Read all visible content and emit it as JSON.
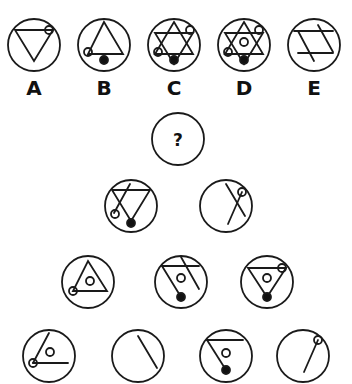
{
  "puzzle": {
    "question_mark": "?",
    "stroke_color": "#1a1a1a",
    "background": "#ffffff",
    "options": [
      {
        "label": "A"
      },
      {
        "label": "B"
      },
      {
        "label": "C"
      },
      {
        "label": "D"
      },
      {
        "label": "E"
      }
    ]
  }
}
